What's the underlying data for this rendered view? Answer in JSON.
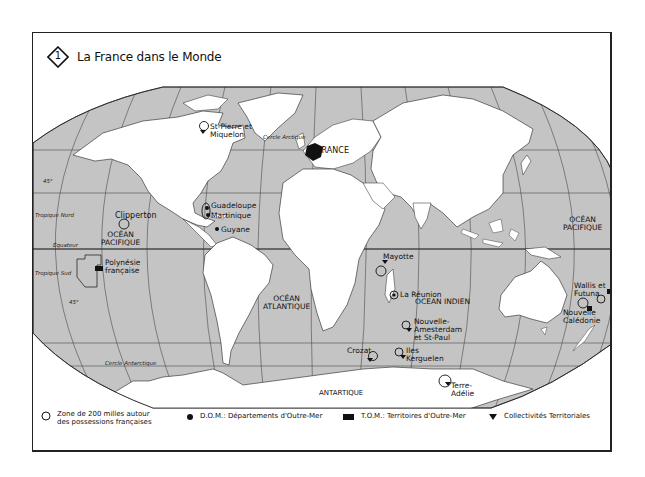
{
  "title": {
    "number": "1",
    "text": "La France dans le Monde"
  },
  "colors": {
    "ocean": "#c4c4c4",
    "land": "#ffffff",
    "france": "#111111",
    "grid": "#333333",
    "border": "#222222"
  },
  "map": {
    "grid_labels": {
      "lat45_north": "45°",
      "lat45_south": "45°",
      "tropic_north": "Tropique Nord",
      "equator": "Équateur",
      "tropic_south": "Tropique Sud",
      "arctic_circle": "Cercle Arctique",
      "antarctic_circle": "Cercle Antarctique"
    },
    "oceans": {
      "pacific_east": "OCÉAN PACIFIQUE",
      "pacific_east_l1": "OCÉAN",
      "pacific_east_l2": "PACIFIQUE",
      "atlantic_l1": "OCÉAN",
      "atlantic_l2": "ATLANTIQUE",
      "indian": "OCEAN INDIEN",
      "pacific_west_l1": "OCÉAN",
      "pacific_west_l2": "PACIFIQUE"
    },
    "continents": {
      "antarctica": "ANTARTIQUE"
    },
    "places": [
      {
        "id": "france",
        "label": "FRANCE",
        "type": "metropole"
      },
      {
        "id": "st-pierre",
        "label_l1": "St-Pierre et",
        "label_l2": "Miquelon",
        "type": "collectivite"
      },
      {
        "id": "guadeloupe",
        "label": "Guadeloupe",
        "type": "dom"
      },
      {
        "id": "martinique",
        "label": "Martinique",
        "type": "dom"
      },
      {
        "id": "guyane",
        "label": "Guyane",
        "type": "dom"
      },
      {
        "id": "clipperton",
        "label": "Clipperton",
        "type": "zone"
      },
      {
        "id": "polynesie",
        "label_l1": "Polynésie",
        "label_l2": "française",
        "type": "tom"
      },
      {
        "id": "mayotte",
        "label": "Mayotte",
        "type": "collectivite"
      },
      {
        "id": "reunion",
        "label": "La Réunion",
        "type": "dom"
      },
      {
        "id": "amsterdam",
        "label_l1": "Nouvelle-",
        "label_l2": "Amesterdam",
        "label_l3": "et St-Paul",
        "type": "collectivite"
      },
      {
        "id": "crozet",
        "label": "Crozat",
        "type": "collectivite"
      },
      {
        "id": "kerguelen",
        "label_l1": "Iles",
        "label_l2": "Kerguelen",
        "type": "collectivite"
      },
      {
        "id": "terre-adelie",
        "label_l1": "Terre-",
        "label_l2": "Adélie",
        "type": "collectivite"
      },
      {
        "id": "wallis",
        "label_l1": "Wallis et",
        "label_l2": "Futuna",
        "type": "tom"
      },
      {
        "id": "caledonie",
        "label_l1": "Nouvelle",
        "label_l2": "Calédonie",
        "type": "tom"
      }
    ]
  },
  "legend": {
    "zone_l1": "Zone de 200 milles autour",
    "zone_l2": "des possessions françaises",
    "dom": "D.O.M.: Départements d'Outre-Mer",
    "tom": "T.O.M.: Territoires d'Outre-Mer",
    "collectivites": "Collectivités Territoriales"
  }
}
